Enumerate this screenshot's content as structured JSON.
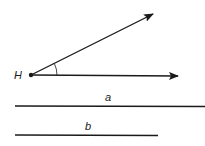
{
  "diagram": {
    "point": {
      "label": "H",
      "x": 31,
      "y": 75
    },
    "rays": [
      {
        "name": "upper-ray",
        "x2": 153,
        "y2": 14
      },
      {
        "name": "horizontal-ray",
        "x2": 178,
        "y2": 76
      }
    ],
    "angle_arc": {
      "radius": 26
    },
    "segments": [
      {
        "label": "a",
        "x1": 15,
        "x2": 205,
        "y": 106,
        "label_x": 108,
        "label_y": 101
      },
      {
        "label": "b",
        "x1": 15,
        "x2": 158,
        "y": 135,
        "label_x": 88,
        "label_y": 130
      }
    ],
    "colors": {
      "stroke": "#1a1a1a",
      "background": "#ffffff"
    }
  }
}
